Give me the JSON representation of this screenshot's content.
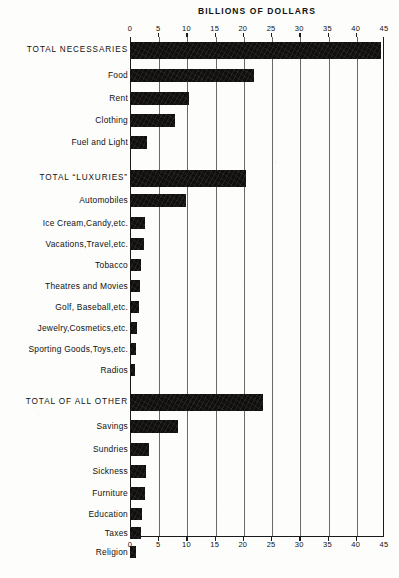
{
  "chart_data": {
    "type": "bar",
    "orientation": "horizontal",
    "title": "BILLIONS OF DOLLARS",
    "xlabel": "BILLIONS OF DOLLARS",
    "ylabel": "",
    "xlim": [
      0,
      45
    ],
    "xticks": [
      0,
      5,
      10,
      15,
      20,
      25,
      30,
      35,
      40,
      45
    ],
    "xtick_labels": [
      "0",
      "5",
      "10",
      "15",
      "20",
      "25",
      "30",
      "35",
      "40",
      "45"
    ],
    "grid": true,
    "grid_axis": "x",
    "legend": false,
    "axis_positions": [
      "top",
      "bottom"
    ],
    "bar_color": "#100f0e",
    "categories": [
      "TOTAL NECESSARIES",
      "Food",
      "Rent",
      "Clothing",
      "Fuel and Light",
      "TOTAL “LUXURIES”",
      "Automobiles",
      "Ice Cream,Candy,etc.",
      "Vacations,Travel,etc.",
      "Tobacco",
      "Theatres and Movies",
      "Golf, Baseball,etc.",
      "Jewelry,Cosmetics,etc.",
      "Sporting Goods,Toys,etc.",
      "Radios",
      "TOTAL OF ALL OTHER",
      "Savings",
      "Sundries",
      "Sickness",
      "Furniture",
      "Education",
      "Taxes",
      "Religion"
    ],
    "values": [
      44.5,
      22.0,
      10.5,
      8.0,
      3.0,
      20.5,
      10.0,
      2.6,
      2.4,
      2.0,
      1.7,
      1.6,
      1.2,
      1.1,
      0.9,
      23.5,
      8.5,
      3.4,
      2.8,
      2.7,
      2.2,
      2.0,
      1.0
    ],
    "groups": [
      {
        "name": "Necessaries",
        "total_label": "TOTAL NECESSARIES",
        "total_value": 44.5,
        "items": [
          {
            "label": "Food",
            "value": 22.0
          },
          {
            "label": "Rent",
            "value": 10.5
          },
          {
            "label": "Clothing",
            "value": 8.0
          },
          {
            "label": "Fuel and Light",
            "value": 3.0
          }
        ]
      },
      {
        "name": "Luxuries",
        "total_label": "TOTAL “LUXURIES”",
        "total_value": 20.5,
        "items": [
          {
            "label": "Automobiles",
            "value": 10.0
          },
          {
            "label": "Ice Cream,Candy,etc.",
            "value": 2.6
          },
          {
            "label": "Vacations,Travel,etc.",
            "value": 2.4
          },
          {
            "label": "Tobacco",
            "value": 2.0
          },
          {
            "label": "Theatres and Movies",
            "value": 1.7
          },
          {
            "label": "Golf, Baseball,etc.",
            "value": 1.6
          },
          {
            "label": "Jewelry,Cosmetics,etc.",
            "value": 1.2
          },
          {
            "label": "Sporting Goods,Toys,etc.",
            "value": 1.1
          },
          {
            "label": "Radios",
            "value": 0.9
          }
        ]
      },
      {
        "name": "All Other",
        "total_label": "TOTAL OF ALL OTHER",
        "total_value": 23.5,
        "items": [
          {
            "label": "Savings",
            "value": 8.5
          },
          {
            "label": "Sundries",
            "value": 3.4
          },
          {
            "label": "Sickness",
            "value": 2.8
          },
          {
            "label": "Furniture",
            "value": 2.7
          },
          {
            "label": "Education",
            "value": 2.2
          },
          {
            "label": "Taxes",
            "value": 2.0
          },
          {
            "label": "Religion",
            "value": 1.0
          }
        ]
      }
    ]
  },
  "rows": [
    {
      "label": "TOTAL NECESSARIES",
      "value": 44.5,
      "total": true,
      "y": 42,
      "h": 17
    },
    {
      "label": "Food",
      "value": 22.0,
      "total": false,
      "y": 69,
      "h": 13
    },
    {
      "label": "Rent",
      "value": 10.5,
      "total": false,
      "h": 13,
      "y": 92
    },
    {
      "label": "Clothing",
      "value": 8.0,
      "total": false,
      "y": 114,
      "h": 13
    },
    {
      "label": "Fuel and Light",
      "value": 3.0,
      "total": false,
      "y": 136,
      "h": 13
    },
    {
      "label": "TOTAL “LUXURIES”",
      "value": 20.5,
      "total": true,
      "y": 170,
      "h": 17
    },
    {
      "label": "Automobiles",
      "value": 10.0,
      "total": false,
      "y": 194,
      "h": 13
    },
    {
      "label": "Ice Cream,Candy,etc.",
      "value": 2.6,
      "total": false,
      "y": 217,
      "h": 12
    },
    {
      "label": "Vacations,Travel,etc.",
      "value": 2.4,
      "total": false,
      "y": 238,
      "h": 12
    },
    {
      "label": "Tobacco",
      "value": 2.0,
      "total": false,
      "y": 259,
      "h": 12
    },
    {
      "label": "Theatres and Movies",
      "value": 1.7,
      "total": false,
      "y": 280,
      "h": 12
    },
    {
      "label": "Golf, Baseball,etc.",
      "value": 1.6,
      "total": false,
      "y": 301,
      "h": 12
    },
    {
      "label": "Jewelry,Cosmetics,etc.",
      "value": 1.2,
      "total": false,
      "y": 322,
      "h": 12
    },
    {
      "label": "Sporting Goods,Toys,etc.",
      "value": 1.1,
      "total": false,
      "y": 343,
      "h": 12
    },
    {
      "label": "Radios",
      "value": 0.9,
      "total": false,
      "y": 364,
      "h": 12
    },
    {
      "label": "TOTAL OF ALL OTHER",
      "value": 23.5,
      "total": true,
      "y": 394,
      "h": 17
    },
    {
      "label": "Savings",
      "value": 8.5,
      "total": false,
      "y": 420,
      "h": 13
    },
    {
      "label": "Sundries",
      "value": 3.4,
      "total": false,
      "y": 443,
      "h": 13
    },
    {
      "label": "Sickness",
      "value": 2.8,
      "total": false,
      "y": 465,
      "h": 13
    },
    {
      "label": "Furniture",
      "value": 2.7,
      "total": false,
      "y": 487,
      "h": 13
    },
    {
      "label": "Education",
      "value": 2.2,
      "total": false,
      "y": 508,
      "h": 12
    },
    {
      "label": "Taxes",
      "value": 2.0,
      "total": false,
      "y": 527,
      "h": 12
    },
    {
      "label": "Religion",
      "value": 1.0,
      "total": false,
      "y": 546,
      "h": 12
    }
  ]
}
